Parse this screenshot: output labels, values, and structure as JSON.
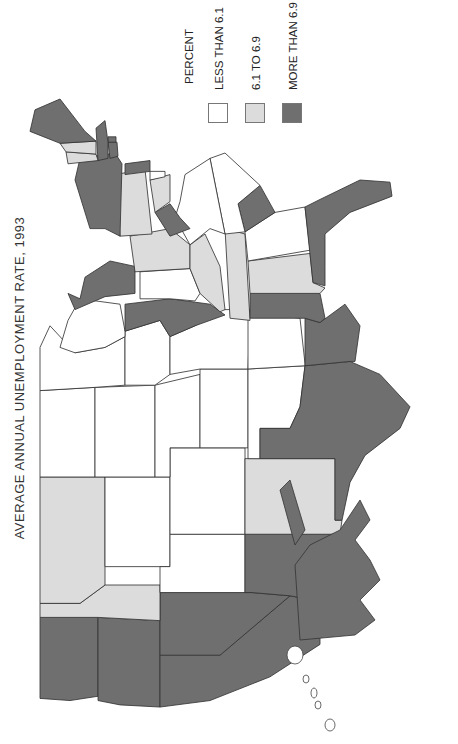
{
  "title": "AVERAGE ANNUAL UNEMPLOYMENT RATE, 1993",
  "legend": {
    "title": "PERCENT",
    "items": [
      {
        "label": "LESS THAN 6.1",
        "category": "low",
        "color": "#ffffff"
      },
      {
        "label": "6.1 TO 6.9",
        "category": "mid",
        "color": "#dcdcdc"
      },
      {
        "label": "MORE THAN 6.9",
        "category": "high",
        "color": "#6f6f6f"
      }
    ]
  },
  "chart_data": {
    "type": "choropleth",
    "title": "AVERAGE ANNUAL UNEMPLOYMENT RATE, 1993",
    "orientation": "rotated 90 degrees counter-clockwise",
    "legend_title": "PERCENT",
    "classes": [
      "LESS THAN 6.1",
      "6.1 TO 6.9",
      "MORE THAN 6.9"
    ],
    "states": {
      "WA": "high",
      "OR": "high",
      "CA": "high",
      "NV": "high",
      "AZ": "high",
      "NM": "mid",
      "ID": "mid",
      "MT": "mid",
      "WY": "low",
      "UT": "low",
      "CO": "low",
      "ND": "low",
      "SD": "low",
      "NE": "low",
      "KS": "low",
      "OK": "low",
      "TX": "high",
      "MN": "low",
      "IA": "low",
      "MO": "low",
      "AR": "low",
      "LA": "high",
      "WI": "low",
      "IL": "high",
      "MI": "high",
      "IN": "low",
      "OH": "mid",
      "KY": "mid",
      "TN": "mid",
      "MS": "high",
      "AL": "mid",
      "GA": "low",
      "FL": "high",
      "WV": "high",
      "VA": "low",
      "NC": "low",
      "SC": "high",
      "PA": "mid",
      "NY": "high",
      "NJ": "high",
      "DE": "low",
      "MD": "mid",
      "DC": "high",
      "CT": "high",
      "RI": "high",
      "MA": "high",
      "VT": "mid",
      "NH": "mid",
      "ME": "high",
      "AK": "high",
      "HI": "low"
    }
  },
  "states": [
    {
      "id": "WA",
      "cat": "high",
      "pts": "20,20 95,20 95,78 22,78 18,50"
    },
    {
      "id": "OR",
      "cat": "high",
      "pts": "18,78 95,78 92,140 12,140 14,100"
    },
    {
      "id": "CA",
      "cat": "high",
      "pts": "12,140 60,140 60,200 115,270 110,300 70,300 40,250 18,190"
    },
    {
      "id": "NV",
      "cat": "high",
      "pts": "60,140 118,140 118,232 115,270 60,200"
    },
    {
      "id": "ID",
      "cat": "mid",
      "pts": "95,20 108,20 108,60 125,85 125,140 92,140 95,78"
    },
    {
      "id": "MT",
      "cat": "mid",
      "pts": "108,20 225,20 225,85 125,85 108,60"
    },
    {
      "id": "WY",
      "cat": "low",
      "pts": "142,85 225,85 225,150 142,150"
    },
    {
      "id": "UT",
      "cat": "low",
      "pts": "118,140 142,140 142,150 172,150 172,225 118,225"
    },
    {
      "id": "AZ",
      "cat": "high",
      "pts": "118,225 172,225 172,320 130,318 110,300 115,270 118,232"
    },
    {
      "id": "CO",
      "cat": "low",
      "pts": "172,150 252,150 252,225 172,225"
    },
    {
      "id": "NM",
      "cat": "mid",
      "pts": "172,225 242,225 242,315 185,315 185,322 172,320"
    },
    {
      "id": "ND",
      "cat": "low",
      "pts": "225,20 305,20 308,75 225,75"
    },
    {
      "id": "SD",
      "cat": "low",
      "pts": "225,75 308,75 310,135 225,135"
    },
    {
      "id": "NE",
      "cat": "low",
      "pts": "225,135 310,135 320,180 252,180 252,150 225,150"
    },
    {
      "id": "KS",
      "cat": "low",
      "pts": "252,180 325,180 325,228 252,228"
    },
    {
      "id": "OK",
      "cat": "low",
      "pts": "242,228 325,228 328,285 290,280 270,270 270,240 242,240"
    },
    {
      "id": "TX",
      "cat": "high",
      "pts": "242,240 270,240 270,270 290,280 328,285 332,330 320,360 290,390 270,380 245,345 220,330 185,322 185,315 242,315"
    },
    {
      "id": "MN",
      "cat": "low",
      "pts": "305,20 345,20 365,30 340,55 345,85 355,105 310,105 308,75"
    },
    {
      "id": "IA",
      "cat": "low",
      "pts": "310,105 360,105 370,140 355,150 320,150 310,135"
    },
    {
      "id": "MO",
      "cat": "low",
      "pts": "320,150 355,150 365,175 380,200 380,230 325,228 325,180"
    },
    {
      "id": "AR",
      "cat": "low",
      "pts": "325,228 378,228 372,280 330,285 328,285"
    },
    {
      "id": "LA",
      "cat": "high",
      "pts": "328,285 372,285 368,300 385,325 365,340 332,335 332,330"
    },
    {
      "id": "WI",
      "cat": "low",
      "pts": "345,40 370,48 390,60 385,100 360,105 355,105 345,85 340,55"
    },
    {
      "id": "IL",
      "cat": "high",
      "pts": "360,105 385,105 390,150 385,190 375,205 365,175 355,150 370,140"
    },
    {
      "id": "MI",
      "cat": "high",
      "pts": "390,60 410,65 425,90 420,115 395,115 392,85 380,55 395,48"
    },
    {
      "id": "IN",
      "cat": "low",
      "pts": "390,120 415,120 418,170 395,180 388,175 390,150"
    },
    {
      "id": "OH",
      "cat": "mid",
      "pts": "415,115 448,110 455,150 440,170 418,170"
    },
    {
      "id": "KY",
      "cat": "mid",
      "pts": "378,200 395,180 418,170 440,170 450,185 420,200 380,205"
    },
    {
      "id": "TN",
      "cat": "mid",
      "pts": "372,210 455,205 450,225 370,230"
    },
    {
      "id": "MS",
      "cat": "high",
      "pts": "372,230 395,230 395,300 372,305 368,300 372,285"
    },
    {
      "id": "AL",
      "cat": "mid",
      "pts": "395,230 425,228 432,290 405,293 400,305 395,300"
    },
    {
      "id": "GA",
      "cat": "low",
      "pts": "425,228 452,225 470,255 475,285 435,290"
    },
    {
      "id": "FL",
      "cat": "high",
      "pts": "405,293 475,285 482,300 500,340 498,370 485,372 470,330 450,305 420,305 402,305"
    },
    {
      "id": "SC",
      "cat": "high",
      "pts": "452,225 478,218 495,240 470,255"
    },
    {
      "id": "NC",
      "cat": "low",
      "pts": "450,205 520,190 525,205 495,240 478,218 452,225"
    },
    {
      "id": "VA",
      "cat": "low",
      "pts": "440,170 465,155 480,160 505,165 520,190 450,205 455,190"
    },
    {
      "id": "WV",
      "cat": "high",
      "pts": "448,150 470,135 478,150 465,160 455,170"
    },
    {
      "id": "MD",
      "cat": "mid",
      "pts": "470,135 500,130 505,150 480,150"
    },
    {
      "id": "DE",
      "cat": "low",
      "pts": "500,130 508,130 508,145 503,145"
    },
    {
      "id": "PA",
      "cat": "mid",
      "pts": "448,100 505,95 510,125 450,132"
    },
    {
      "id": "NJ",
      "cat": "high",
      "pts": "505,105 515,105 518,130 508,130"
    },
    {
      "id": "NY",
      "cat": "high",
      "pts": "455,70 500,55 520,60 525,95 515,102 448,100 455,85"
    },
    {
      "id": "CT",
      "cat": "high",
      "pts": "520,90 535,88 535,97 522,98"
    },
    {
      "id": "RI",
      "cat": "high",
      "pts": "535,88 540,88 540,96 535,96"
    },
    {
      "id": "MA",
      "cat": "high",
      "pts": "518,78 548,76 555,85 535,88 520,88"
    },
    {
      "id": "VT",
      "cat": "mid",
      "pts": "515,48 526,46 524,76 518,78"
    },
    {
      "id": "NH",
      "cat": "mid",
      "pts": "526,46 534,40 536,76 524,76"
    },
    {
      "id": "ME",
      "cat": "high",
      "pts": "534,40 545,10 565,15 575,40 545,65 536,76"
    }
  ],
  "alaska": {
    "cat": "high"
  },
  "hawaii": {
    "cat": "low"
  }
}
